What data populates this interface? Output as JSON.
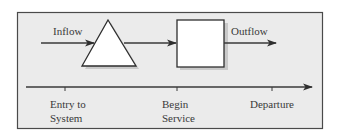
{
  "diagram": {
    "type": "queueing-system-flow",
    "colors": {
      "frame_fill": "#ebebeb",
      "frame_stroke": "#4a4a4a",
      "shape_fill": "#ffffff",
      "shape_stroke": "#2e2e2e",
      "shadow": "#bdbdbd",
      "line": "#3a3a3a",
      "text": "#3a3a3a"
    },
    "flow_labels": {
      "inflow": "Inflow",
      "outflow": "Outflow"
    },
    "nodes": [
      {
        "id": "queue",
        "shape": "triangle",
        "semantic": "queue-inventory-icon"
      },
      {
        "id": "server",
        "shape": "square",
        "semantic": "service-process-icon"
      }
    ],
    "edges": [
      {
        "from": "source",
        "to": "queue",
        "label": "Inflow"
      },
      {
        "from": "queue",
        "to": "server",
        "label": ""
      },
      {
        "from": "server",
        "to": "sink",
        "label": "Outflow"
      }
    ],
    "timeline": {
      "ticks": [
        {
          "line1": "Entry to",
          "line2": "System"
        },
        {
          "line1": "Begin",
          "line2": "Service"
        },
        {
          "line1": "Departure",
          "line2": ""
        }
      ]
    }
  }
}
